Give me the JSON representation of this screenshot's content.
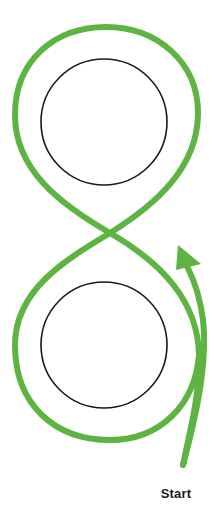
{
  "diagram": {
    "type": "figure-eight-path",
    "colors": {
      "path": "#5eb443",
      "obstacle_stroke": "#1a1a1a",
      "background": "#ffffff",
      "label": "#1a1a1a"
    },
    "obstacles": [
      {
        "name": "upper-circle",
        "cx": 104,
        "cy": 122,
        "r": 63
      },
      {
        "name": "lower-circle",
        "cx": 104,
        "cy": 345,
        "r": 63
      }
    ],
    "start_label": "Start",
    "direction": "up (arrow points upward on right side of lower loop)"
  }
}
